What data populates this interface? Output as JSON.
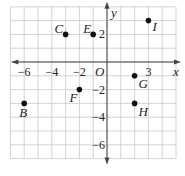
{
  "plane": {
    "x_axis_label": "x",
    "y_axis_label": "y",
    "origin_label": "O",
    "x_range": [
      -7,
      5
    ],
    "y_range": [
      -7,
      4
    ],
    "x_tick_labels": [
      {
        "value": -6,
        "text": "−6"
      },
      {
        "value": -4,
        "text": "−4"
      },
      {
        "value": -2,
        "text": "−2"
      },
      {
        "value": 3,
        "text": "3"
      }
    ],
    "y_tick_labels": [
      {
        "value": 2,
        "text": "2"
      },
      {
        "value": -2,
        "text": "−2"
      },
      {
        "value": -4,
        "text": "−4"
      },
      {
        "value": -6,
        "text": "−6"
      }
    ],
    "colors": {
      "grid": "#c8c8c8",
      "axis": "#444444",
      "point": "#111111",
      "text": "#222222"
    }
  },
  "points": [
    {
      "name": "B",
      "x": -6,
      "y": -3
    },
    {
      "name": "C",
      "x": -3,
      "y": 2
    },
    {
      "name": "E",
      "x": -1,
      "y": 2
    },
    {
      "name": "F",
      "x": -2,
      "y": -2
    },
    {
      "name": "G",
      "x": 2,
      "y": -1
    },
    {
      "name": "H",
      "x": 2,
      "y": -3
    },
    {
      "name": "I",
      "x": 3,
      "y": 3
    }
  ]
}
